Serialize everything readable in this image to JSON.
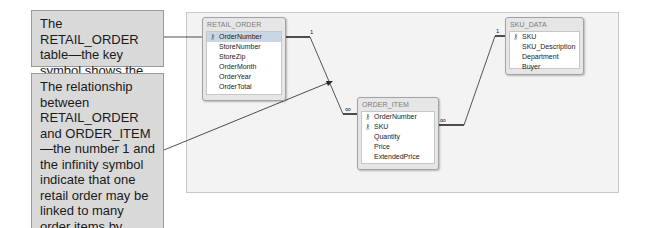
{
  "callouts": {
    "primary_key": "The RETAIL_ORDER table—the key symbol shows the primary key",
    "relationship": "The relationship between RETAIL_ORDER and ORDER_ITEM—the number 1 and the infinity symbol indicate that one retail order may be linked to many order items by OrderNumber"
  },
  "tables": {
    "retail_order": {
      "title": "RETAIL_ORDER",
      "fields": [
        {
          "name": "OrderNumber",
          "key": true,
          "selected": true
        },
        {
          "name": "StoreNumber",
          "key": false
        },
        {
          "name": "StoreZip",
          "key": false
        },
        {
          "name": "OrderMonth",
          "key": false
        },
        {
          "name": "OrderYear",
          "key": false
        },
        {
          "name": "OrderTotal",
          "key": false
        }
      ]
    },
    "order_item": {
      "title": "ORDER_ITEM",
      "fields": [
        {
          "name": "OrderNumber",
          "key": true
        },
        {
          "name": "SKU",
          "key": true
        },
        {
          "name": "Quantity",
          "key": false
        },
        {
          "name": "Price",
          "key": false
        },
        {
          "name": "ExtendedPrice",
          "key": false
        }
      ]
    },
    "sku_data": {
      "title": "SKU_DATA",
      "fields": [
        {
          "name": "SKU",
          "key": true
        },
        {
          "name": "SKU_Description",
          "key": false
        },
        {
          "name": "Department",
          "key": false
        },
        {
          "name": "Buyer",
          "key": false
        }
      ]
    }
  },
  "relationships": [
    {
      "from": "RETAIL_ORDER.OrderNumber",
      "to": "ORDER_ITEM.OrderNumber",
      "one_label": "1",
      "many_label": "∞"
    },
    {
      "from": "SKU_DATA.SKU",
      "to": "ORDER_ITEM.SKU",
      "one_label": "1",
      "many_label": "∞"
    }
  ],
  "icons": {
    "key": "⚷"
  }
}
